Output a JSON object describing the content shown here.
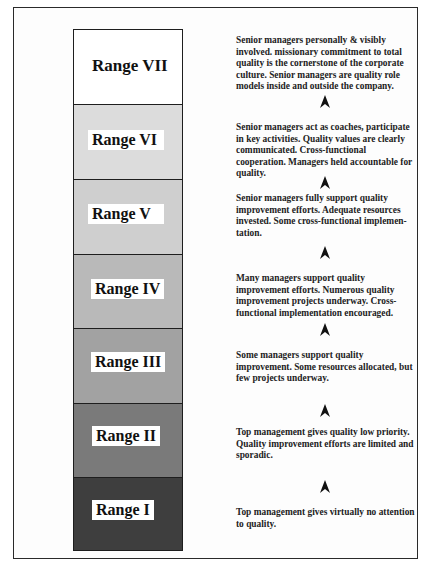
{
  "figure": {
    "colors": {
      "frame": "#2a2a2a",
      "range_vii": "#ffffff",
      "range_vi": "#dcdcdc",
      "range_v": "#cfcfcf",
      "range_iv": "#b9b9b9",
      "range_iii": "#a2a2a2",
      "range_ii": "#7a7a7a",
      "range_i": "#3e3e3e"
    },
    "ranges": [
      {
        "label": "Range VII",
        "description": "Senior managers personally & visibly involved. missionary commitment to total quality is the cornerstone of the corporate culture.  Senior managers are quality role models inside and outside the company."
      },
      {
        "label": "Range VI",
        "description": "Senior managers act as coaches, participate in key activities.  Quality values are clearly communicated. Cross-functional cooperation. Managers held accountable for quality."
      },
      {
        "label": "Range V",
        "description": "Senior managers fully support quality improvement efforts.  Adequate resources invested.  Some cross-functional implemen-tation."
      },
      {
        "label": "Range IV",
        "description": "Many managers support quality improvement efforts.  Numerous quality improvement projects underway.  Cross-functional implementation encouraged."
      },
      {
        "label": "Range III",
        "description": "Some managers support quality improvement.  Some resources allocated, but few projects underway."
      },
      {
        "label": "Range II",
        "description": "Top management gives quality low priority. Quality improvement efforts are limited and sporadic."
      },
      {
        "label": "Range I",
        "description": "Top management gives virtually no attention to quality."
      }
    ],
    "arrow_icon": "up-arrowhead-icon"
  }
}
